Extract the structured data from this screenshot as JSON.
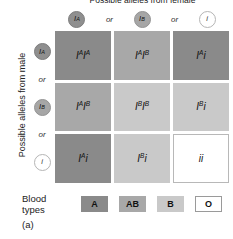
{
  "figure": {
    "panel_label": "(a)",
    "top_axis_title": "Possible alleles from female",
    "left_axis_title": "Possible alleles from male"
  },
  "columns": {
    "separator": "or",
    "headers": [
      {
        "symbol": "I",
        "superscript": "A",
        "token": "A-allele-token"
      },
      {
        "symbol": "I",
        "superscript": "B",
        "token": "B-allele-token"
      },
      {
        "symbol": "i",
        "superscript": "",
        "token": "i-allele-token"
      }
    ]
  },
  "rows": {
    "separator": "or",
    "headers": [
      {
        "symbol": "I",
        "superscript": "A",
        "token": "A-allele-token"
      },
      {
        "symbol": "I",
        "superscript": "B",
        "token": "B-allele-token"
      },
      {
        "symbol": "i",
        "superscript": "",
        "token": "i-allele-token"
      }
    ]
  },
  "grid": {
    "cells": [
      {
        "genotype": "IAIA",
        "blood_type": "A",
        "parts": [
          {
            "s": "I",
            "sup": "A"
          },
          {
            "s": "I",
            "sup": "A"
          }
        ]
      },
      {
        "genotype": "IAIB",
        "blood_type": "AB",
        "parts": [
          {
            "s": "I",
            "sup": "A"
          },
          {
            "s": "I",
            "sup": "B"
          }
        ]
      },
      {
        "genotype": "IAi",
        "blood_type": "A",
        "parts": [
          {
            "s": "I",
            "sup": "A"
          },
          {
            "s": "i",
            "sup": ""
          }
        ]
      },
      {
        "genotype": "IAIB",
        "blood_type": "AB",
        "parts": [
          {
            "s": "I",
            "sup": "A"
          },
          {
            "s": "I",
            "sup": "B"
          }
        ]
      },
      {
        "genotype": "IBIB",
        "blood_type": "B",
        "parts": [
          {
            "s": "I",
            "sup": "B"
          },
          {
            "s": "I",
            "sup": "B"
          }
        ]
      },
      {
        "genotype": "IBi",
        "blood_type": "B",
        "parts": [
          {
            "s": "I",
            "sup": "B"
          },
          {
            "s": "i",
            "sup": ""
          }
        ]
      },
      {
        "genotype": "IAi",
        "blood_type": "A",
        "parts": [
          {
            "s": "I",
            "sup": "A"
          },
          {
            "s": "i",
            "sup": ""
          }
        ]
      },
      {
        "genotype": "IBi",
        "blood_type": "B",
        "parts": [
          {
            "s": "I",
            "sup": "B"
          },
          {
            "s": "i",
            "sup": ""
          }
        ]
      },
      {
        "genotype": "ii",
        "blood_type": "O",
        "parts": [
          {
            "s": "i",
            "sup": ""
          },
          {
            "s": "i",
            "sup": ""
          }
        ]
      }
    ]
  },
  "legend": {
    "title": "Blood types",
    "items": [
      {
        "label": "A",
        "color": "#8a8a8a"
      },
      {
        "label": "AB",
        "color": "#a8a8a8"
      },
      {
        "label": "B",
        "color": "#c9c9c9"
      },
      {
        "label": "O",
        "color": "#ffffff"
      }
    ]
  }
}
